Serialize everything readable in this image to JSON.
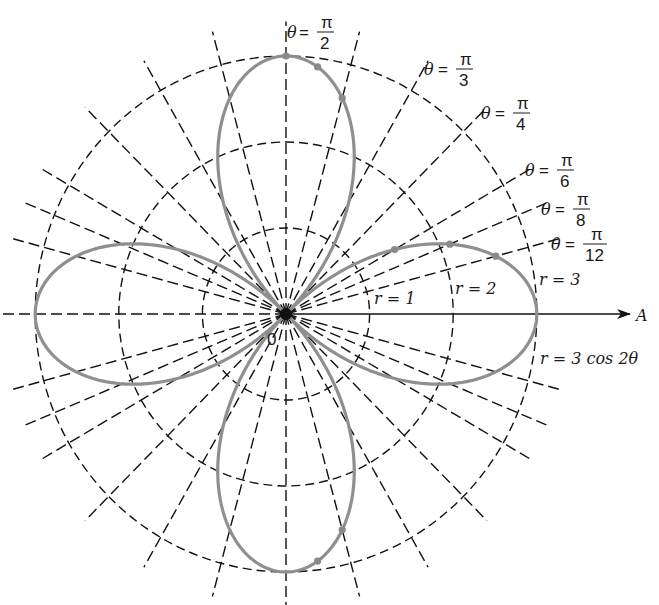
{
  "figure": {
    "origin_label": "0",
    "polar_axis_label": "A",
    "curve_label": "r = 3 cos 2θ",
    "colors": {
      "grid": "#111111",
      "curve": "#8f8f8f",
      "background": "#ffffff"
    }
  },
  "geometry": {
    "center": [
      286,
      314
    ],
    "unit_x": 83.6,
    "unit_y": 86.0,
    "ray_extent": 3.4,
    "axis_left": 3.2,
    "axis_right_px": 630
  },
  "circles": [
    {
      "r": 1,
      "label": "r = 1"
    },
    {
      "r": 2,
      "label": "r = 2"
    },
    {
      "r": 3,
      "label": "r = 3"
    }
  ],
  "rays_deg": [
    15,
    22.5,
    30,
    45,
    60,
    75,
    90,
    105,
    120,
    135,
    150,
    157.5,
    165,
    180,
    195,
    202.5,
    210,
    225,
    240,
    255,
    270,
    285,
    300,
    315,
    330,
    337.5,
    345
  ],
  "angle_labels": [
    {
      "theta": "θ",
      "num": "π",
      "den": "2",
      "name": "theta-pi-over-2"
    },
    {
      "theta": "θ",
      "num": "π",
      "den": "3",
      "name": "theta-pi-over-3"
    },
    {
      "theta": "θ",
      "num": "π",
      "den": "4",
      "name": "theta-pi-over-4"
    },
    {
      "theta": "θ",
      "num": "π",
      "den": "6",
      "name": "theta-pi-over-6"
    },
    {
      "theta": "θ",
      "num": "π",
      "den": "8",
      "name": "theta-pi-over-8"
    },
    {
      "theta": "θ",
      "num": "π",
      "den": "12",
      "name": "theta-pi-over-12"
    }
  ],
  "chart_data": {
    "type": "polar",
    "title": "r = 3 cos 2θ",
    "equation": "r = 3 cos 2θ",
    "grid_circles": [
      1,
      2,
      3
    ],
    "grid_angles_rad": [
      "0",
      "π/12",
      "π/8",
      "π/6",
      "π/4",
      "π/3",
      "5π/12",
      "π/2"
    ],
    "labeled_angles": [
      "π/2",
      "π/3",
      "π/4",
      "π/6",
      "π/8",
      "π/12"
    ],
    "polar_axis": "A",
    "pole": "0",
    "plotted_points": [
      {
        "theta": "0",
        "r": 3
      },
      {
        "theta": "π/12",
        "r": 2.6
      },
      {
        "theta": "π/8",
        "r": 2.12
      },
      {
        "theta": "π/6",
        "r": 1.5
      },
      {
        "theta": "π/4",
        "r": 0
      },
      {
        "theta": "π/2",
        "r": -3
      }
    ],
    "petals": 4,
    "max_r": 3
  }
}
